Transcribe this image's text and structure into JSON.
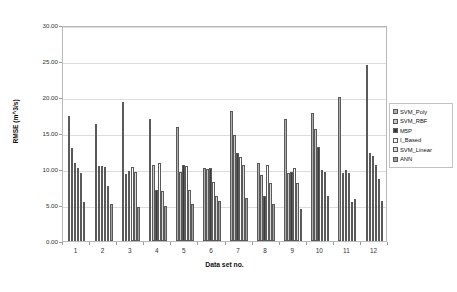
{
  "chart_data": {
    "type": "bar",
    "title": "",
    "xlabel": "Data set no.",
    "ylabel": "RMSE (m^3/s)",
    "ylim": [
      0,
      30
    ],
    "ytick_step": 5,
    "ytick_labels": [
      "0.00",
      "5.00",
      "10.00",
      "15.00",
      "20.00",
      "25.00",
      "30.00"
    ],
    "ytick_values": [
      0,
      5,
      10,
      15,
      20,
      25,
      30
    ],
    "grid": true,
    "legend_position": "right",
    "categories": [
      "1",
      "2",
      "3",
      "4",
      "5",
      "6",
      "7",
      "8",
      "9",
      "10",
      "11",
      "12"
    ],
    "series": [
      {
        "name": "SVM_Poly",
        "color": "#b0b0b0",
        "values": [
          17.4,
          16.2,
          19.3,
          17.0,
          15.8,
          10.2,
          18.0,
          10.9,
          17.0,
          17.8,
          20.0,
          24.5
        ]
      },
      {
        "name": "SVM_RBF",
        "color": "#c8c8c8",
        "values": [
          12.9,
          10.4,
          9.3,
          10.6,
          9.6,
          10.0,
          14.7,
          9.2,
          9.4,
          15.6,
          9.4,
          12.2
        ]
      },
      {
        "name": "M5P",
        "color": "#3c3c3c",
        "values": [
          10.8,
          10.4,
          9.7,
          7.1,
          10.5,
          10.1,
          12.2,
          6.3,
          9.6,
          13.0,
          9.8,
          11.8
        ]
      },
      {
        "name": "I_Based",
        "color": "#fbfbfb",
        "values": [
          10.2,
          10.3,
          10.3,
          10.8,
          10.4,
          8.2,
          11.7,
          10.6,
          10.1,
          9.9,
          9.4,
          10.5
        ]
      },
      {
        "name": "SVM_Linear",
        "color": "#dadada",
        "values": [
          9.4,
          7.7,
          9.6,
          6.9,
          7.1,
          6.3,
          10.6,
          8.1,
          8.1,
          9.6,
          5.4,
          8.6
        ]
      },
      {
        "name": "ANN",
        "color": "#a0a0a0",
        "values": [
          5.4,
          5.1,
          4.7,
          4.8,
          5.1,
          5.5,
          6.0,
          5.1,
          4.4,
          6.2,
          5.9,
          5.5
        ]
      }
    ]
  },
  "legend": {
    "items": [
      {
        "label": "SVM_Poly"
      },
      {
        "label": "SVM_RBF"
      },
      {
        "label": "M5P"
      },
      {
        "label": "I_Based"
      },
      {
        "label": "SVM_Linear"
      },
      {
        "label": "ANN"
      }
    ]
  }
}
